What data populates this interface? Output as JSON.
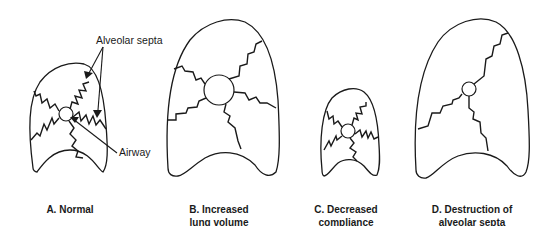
{
  "annotations": {
    "septa_label": "Alveolar septa",
    "airway_label": "Airway"
  },
  "panels": [
    {
      "id": "A",
      "caption_line1": "A. Normal",
      "caption_line2": ""
    },
    {
      "id": "B",
      "caption_line1": "B. Increased",
      "caption_line2": "lung volume"
    },
    {
      "id": "C",
      "caption_line1": "C. Decreased",
      "caption_line2": "compliance"
    },
    {
      "id": "D",
      "caption_line1": "D. Destruction of",
      "caption_line2": "alveolar septa"
    }
  ],
  "colors": {
    "line": "#1a1a1a",
    "background": "#ffffff"
  }
}
